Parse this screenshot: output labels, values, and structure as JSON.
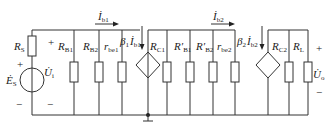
{
  "diagram": {
    "type": "small-signal equivalent circuit (two-stage amplifier)",
    "source": {
      "resistor": {
        "symbol": "R",
        "sub": "S"
      },
      "voltage_source": {
        "symbol": "Ė",
        "sub": "S"
      },
      "input_voltage": {
        "symbol": "U̇",
        "sub": "i"
      },
      "plus": "+",
      "minus": "−"
    },
    "stage1": {
      "current_label": {
        "symbol": "İ",
        "sub": "b1"
      },
      "resistors": [
        {
          "symbol": "R",
          "sub": "B1"
        },
        {
          "symbol": "R",
          "sub": "B2"
        },
        {
          "symbol": "r",
          "sub": "be1"
        }
      ],
      "dependent_source": {
        "beta": "β",
        "beta_sub": "1",
        "current": "İ",
        "current_sub": "b1"
      },
      "collector_resistor": {
        "symbol": "R",
        "sub": "C1"
      }
    },
    "stage2": {
      "current_label": {
        "symbol": "İ",
        "sub": "b2"
      },
      "resistors": [
        {
          "symbol": "R′",
          "sub": "B1"
        },
        {
          "symbol": "R′",
          "sub": "B2"
        },
        {
          "symbol": "r",
          "sub": "be2"
        }
      ],
      "dependent_source": {
        "beta": "β",
        "beta_sub": "2",
        "current": "İ",
        "current_sub": "b2"
      },
      "collector_resistor": {
        "symbol": "R",
        "sub": "C2"
      },
      "load_resistor": {
        "symbol": "R",
        "sub": "L"
      }
    },
    "output": {
      "output_voltage": {
        "symbol": "U̇",
        "sub": "o"
      },
      "plus": "+",
      "minus": "−"
    },
    "ground_symbol": "ground-icon"
  }
}
